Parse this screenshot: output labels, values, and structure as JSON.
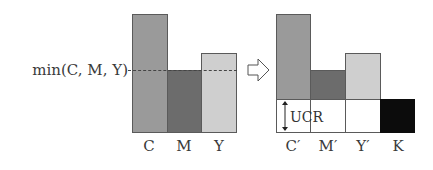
{
  "diagram": {
    "threshold_label": "min(C, M, Y)",
    "transform_arrow": "right-outline-arrow",
    "before": {
      "bars": [
        {
          "label": "C",
          "relative_height": 118,
          "color": "#9a9a9a"
        },
        {
          "label": "M",
          "relative_height": 62,
          "color": "#6c6c6c"
        },
        {
          "label": "Y",
          "relative_height": 79,
          "color": "#cfcfcf"
        }
      ]
    },
    "after": {
      "bars": [
        {
          "label": "C′",
          "relative_height": 85,
          "color": "#9a9a9a"
        },
        {
          "label": "M′",
          "relative_height": 29,
          "color": "#6c6c6c"
        },
        {
          "label": "Y′",
          "relative_height": 46,
          "color": "#cfcfcf"
        },
        {
          "label": "K",
          "relative_height": 33,
          "color": "#0c0c0c"
        }
      ],
      "removed_region_label": "UCR"
    }
  }
}
